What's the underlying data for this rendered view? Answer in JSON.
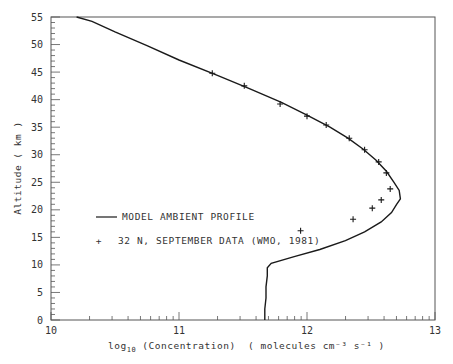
{
  "chart_data": {
    "type": "line",
    "title": "",
    "xlabel": "log10 (Concentration)",
    "xlabel_main": "log",
    "xlabel_sub": "10",
    "xlabel_rest": " (Concentration)",
    "xlabel_units": "( molecules cm⁻³ s⁻¹ )",
    "ylabel": "Altitude ( km )",
    "xlim": [
      10,
      13
    ],
    "ylim": [
      0,
      55
    ],
    "x_scale": "linear (log10 values)",
    "grid": false,
    "legend_position": "inside lower-left",
    "x_ticks": [
      10,
      11,
      12,
      13
    ],
    "y_ticks": [
      0,
      5,
      10,
      15,
      20,
      25,
      30,
      35,
      40,
      45,
      50,
      55
    ],
    "series": [
      {
        "name": "MODEL AMBIENT PROFILE",
        "style": "line",
        "points": [
          [
            11.67,
            0
          ],
          [
            11.67,
            2
          ],
          [
            11.68,
            4
          ],
          [
            11.68,
            6
          ],
          [
            11.69,
            8
          ],
          [
            11.69,
            9.5
          ],
          [
            11.72,
            10.3
          ],
          [
            11.9,
            11.5
          ],
          [
            12.1,
            12.8
          ],
          [
            12.3,
            14.4
          ],
          [
            12.45,
            16
          ],
          [
            12.58,
            17.8
          ],
          [
            12.66,
            19.5
          ],
          [
            12.7,
            21
          ],
          [
            12.73,
            22
          ],
          [
            12.72,
            23.5
          ],
          [
            12.68,
            25
          ],
          [
            12.62,
            27
          ],
          [
            12.54,
            29
          ],
          [
            12.44,
            31
          ],
          [
            12.32,
            33
          ],
          [
            12.18,
            35
          ],
          [
            12.0,
            37.2
          ],
          [
            11.8,
            39.5
          ],
          [
            11.55,
            42
          ],
          [
            11.3,
            44.4
          ],
          [
            11.0,
            47.2
          ],
          [
            10.75,
            49.8
          ],
          [
            10.5,
            52.3
          ],
          [
            10.32,
            54.2
          ],
          [
            10.2,
            55
          ]
        ]
      },
      {
        "name": "32 N, SEPTEMBER DATA (WMO, 1981)",
        "style": "marker-plus",
        "points": [
          [
            11.26,
            44.8
          ],
          [
            11.51,
            42.5
          ],
          [
            11.79,
            39.2
          ],
          [
            12.0,
            37.0
          ],
          [
            12.15,
            35.4
          ],
          [
            12.33,
            33.0
          ],
          [
            12.45,
            30.9
          ],
          [
            12.56,
            28.7
          ],
          [
            12.62,
            26.7
          ],
          [
            12.65,
            23.8
          ],
          [
            12.58,
            21.8
          ],
          [
            12.51,
            20.3
          ],
          [
            12.36,
            18.3
          ],
          [
            11.95,
            16.2
          ]
        ]
      }
    ]
  },
  "legend": {
    "model_label": "MODEL AMBIENT PROFILE",
    "data_label": "32 N, SEPTEMBER DATA (WMO, 1981)",
    "data_marker": "+"
  },
  "colors": {
    "line": "#1a1a1a",
    "axis": "#555555",
    "text": "#333333"
  }
}
